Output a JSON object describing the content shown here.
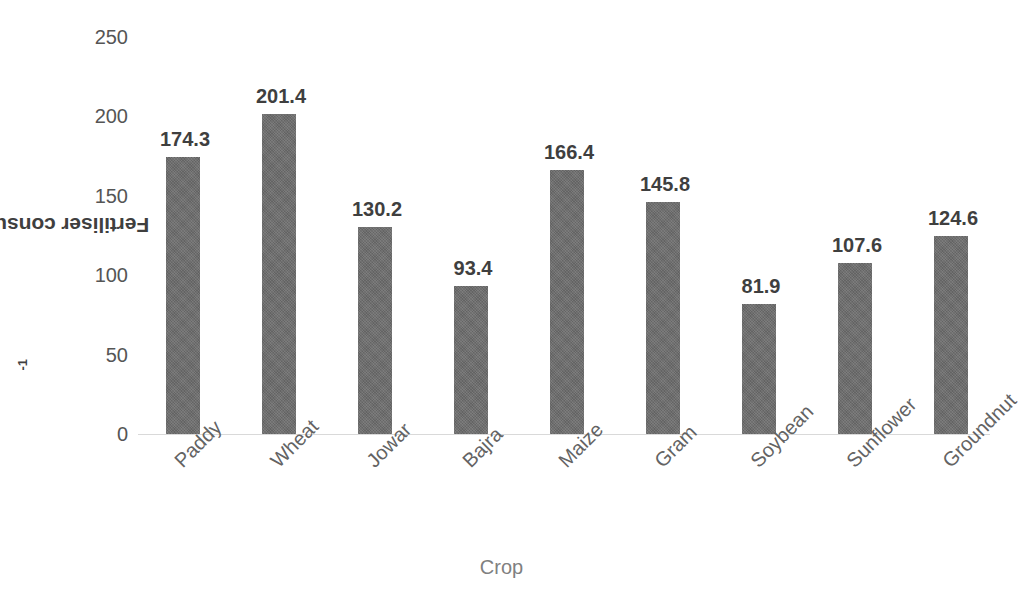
{
  "chart_data": {
    "type": "bar",
    "title": "",
    "xlabel": "Crop",
    "ylabel": "Fertiliser consumption (kg ha-1)",
    "ylabel_prefix": "Fertiliser consumption (kg ha",
    "ylabel_exponent": "-1",
    "ylabel_suffix": ")",
    "categories": [
      "Paddy",
      "Wheat",
      "Jowar",
      "Bajra",
      "Maize",
      "Gram",
      "Soybean",
      "Sunflower",
      "Groundnut"
    ],
    "values": [
      174.3,
      201.4,
      130.2,
      93.4,
      166.4,
      145.8,
      81.9,
      107.6,
      124.6
    ],
    "value_labels": [
      "174.3",
      "201.4",
      "130.2",
      "93.4",
      "166.4",
      "145.8",
      "81.9",
      "107.6",
      "124.6"
    ],
    "ylim": [
      0,
      250
    ],
    "yticks": [
      0,
      50,
      100,
      150,
      200,
      250
    ],
    "ytick_labels": [
      "0",
      "50",
      "100",
      "150",
      "200",
      "250"
    ],
    "grid": false,
    "legend": null,
    "legend_position": "none",
    "series": [
      {
        "name": "Fertiliser consumption",
        "values": [
          174.3,
          201.4,
          130.2,
          93.4,
          166.4,
          145.8,
          81.9,
          107.6,
          124.6
        ]
      }
    ],
    "colors": {
      "bar_fill": "#6e6e6e",
      "data_label": "#3f3f3f",
      "axis_title": "#3f3f3f",
      "xlabel_color": "#808080",
      "tick_label": "#555555",
      "category_label": "#636363",
      "baseline": "#d9d9d9",
      "background": "#ffffff"
    }
  }
}
